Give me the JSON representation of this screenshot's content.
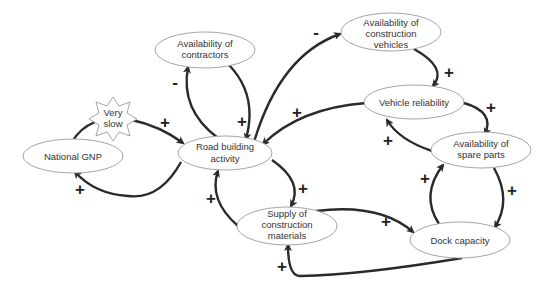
{
  "diagram": {
    "type": "causal loop diagram",
    "nodes": [
      {
        "id": "gnp",
        "label_lines": [
          "National GNP"
        ]
      },
      {
        "id": "very_slow",
        "label_lines": [
          "Very",
          "slow"
        ],
        "shape": "star"
      },
      {
        "id": "contractors",
        "label_lines": [
          "Availability of",
          "contractors"
        ]
      },
      {
        "id": "road",
        "label_lines": [
          "Road building",
          "activity"
        ]
      },
      {
        "id": "vehicles",
        "label_lines": [
          "Availability of",
          "construction",
          "vehicles"
        ]
      },
      {
        "id": "reliability",
        "label_lines": [
          "Vehicle reliability"
        ]
      },
      {
        "id": "spare",
        "label_lines": [
          "Availability of",
          "spare parts"
        ]
      },
      {
        "id": "supply",
        "label_lines": [
          "Supply of",
          "construction",
          "materials"
        ]
      },
      {
        "id": "dock",
        "label_lines": [
          "Dock capacity"
        ]
      }
    ],
    "edges": [
      {
        "from": "gnp",
        "to": "road",
        "sign": "+",
        "note": "via Very slow delay"
      },
      {
        "from": "road",
        "to": "gnp",
        "sign": "+"
      },
      {
        "from": "road",
        "to": "contractors",
        "sign": "-"
      },
      {
        "from": "contractors",
        "to": "road",
        "sign": "+"
      },
      {
        "from": "road",
        "to": "vehicles",
        "sign": "-"
      },
      {
        "from": "vehicles",
        "to": "reliability",
        "sign": "+"
      },
      {
        "from": "reliability",
        "to": "road",
        "sign": "+"
      },
      {
        "from": "reliability",
        "to": "spare",
        "sign": "+"
      },
      {
        "from": "spare",
        "to": "reliability",
        "sign": "+"
      },
      {
        "from": "spare",
        "to": "dock",
        "sign": "+"
      },
      {
        "from": "dock",
        "to": "spare",
        "sign": "+"
      },
      {
        "from": "road",
        "to": "supply",
        "sign": "+"
      },
      {
        "from": "supply",
        "to": "road",
        "sign": "+"
      },
      {
        "from": "supply",
        "to": "dock",
        "sign": "+"
      },
      {
        "from": "dock",
        "to": "supply",
        "sign": "+"
      }
    ],
    "signs": {
      "plus": "+",
      "minus": "-"
    }
  }
}
